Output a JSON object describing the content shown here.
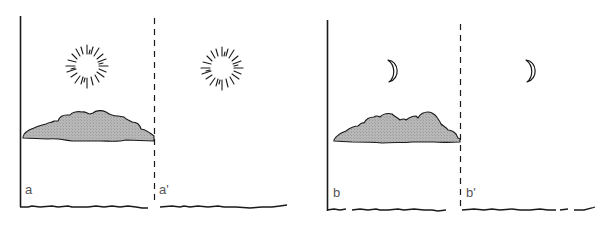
{
  "figure": {
    "colors": {
      "ink": "#1a1a1a",
      "cloud_fill": "#b5b5b5",
      "label": "#555555",
      "background": "#ffffff"
    },
    "panels": [
      {
        "id": "day",
        "sky_icon": "sun",
        "labels": {
          "left": "a",
          "right": "a'"
        }
      },
      {
        "id": "night",
        "sky_icon": "moon",
        "labels": {
          "left": "b",
          "right": "b'"
        }
      }
    ]
  }
}
